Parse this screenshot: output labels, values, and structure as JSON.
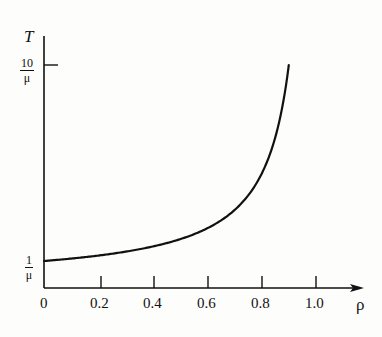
{
  "chart_data": {
    "type": "line",
    "title": "",
    "xlabel": "ρ",
    "ylabel": "T",
    "x_ticks": [
      "0",
      "0.2",
      "0.4",
      "0.6",
      "0.8",
      "1.0"
    ],
    "y_ticks": [
      {
        "num": "1",
        "den": "μ",
        "value_times_mu": 1
      },
      {
        "num": "10",
        "den": "μ",
        "value_times_mu": 10
      }
    ],
    "xlim": [
      0,
      1.1
    ],
    "ylim_times_mu": [
      0,
      10.5
    ],
    "grid": false,
    "legend": null,
    "series": [
      {
        "name": "T = 1/(μ(1−ρ))",
        "x": [
          0,
          0.1,
          0.2,
          0.3,
          0.4,
          0.5,
          0.6,
          0.7,
          0.75,
          0.8,
          0.85,
          0.9
        ],
        "y_times_mu": [
          1.0,
          1.11,
          1.25,
          1.43,
          1.67,
          2.0,
          2.5,
          3.33,
          4.0,
          5.0,
          6.67,
          10.0
        ]
      }
    ]
  },
  "axis": {
    "y_label": "T",
    "x_label": "ρ",
    "y_top_num": "10",
    "y_top_den": "μ",
    "y_low_num": "1",
    "y_low_den": "μ",
    "x_ticks": [
      "0",
      "0.2",
      "0.4",
      "0.6",
      "0.8",
      "1.0"
    ]
  }
}
